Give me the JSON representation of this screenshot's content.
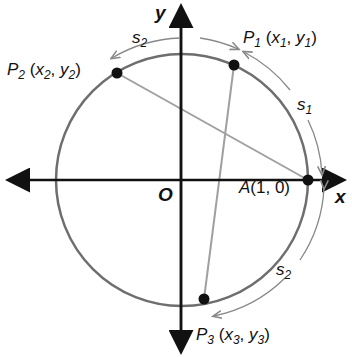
{
  "diagram": {
    "axes": {
      "x_label": "x",
      "y_label": "y",
      "origin_label": "O"
    },
    "points": {
      "A": {
        "name": "A",
        "coords": "(1, 0)"
      },
      "P1": {
        "name": "P",
        "sub": "1",
        "coords_open": " (x",
        "x_sub": "1",
        ", y": ", y",
        "y_sub": "1",
        "close": ")"
      },
      "P2": {
        "name": "P",
        "sub": "2",
        "x_sub": "2",
        "y_sub": "2"
      },
      "P3": {
        "name": "P",
        "sub": "3",
        "x_sub": "3",
        "y_sub": "3"
      }
    },
    "arcs": {
      "s1": {
        "name": "s",
        "sub": "1"
      },
      "s2_top": {
        "name": "s",
        "sub": "2"
      },
      "s2_bottom": {
        "name": "s",
        "sub": "2"
      }
    },
    "colors": {
      "circle": "#6e6e6e",
      "chord": "#9a9a9a",
      "axis": "#111111",
      "arc_arrow": "#8a8a8a"
    }
  }
}
